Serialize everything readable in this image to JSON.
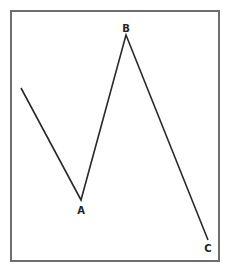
{
  "diagram": {
    "type": "zigzag-wave",
    "points": [
      {
        "name": "start",
        "x": 21,
        "y": 88,
        "label": ""
      },
      {
        "name": "A",
        "x": 81,
        "y": 200,
        "label": "A"
      },
      {
        "name": "B",
        "x": 126,
        "y": 35,
        "label": "B"
      },
      {
        "name": "C",
        "x": 208,
        "y": 240,
        "label": "C"
      }
    ],
    "labels": {
      "a": "A",
      "b": "B",
      "c": "C"
    },
    "colors": {
      "line": "#2a2a2a",
      "border": "#6e6e6e",
      "background": "#ffffff"
    }
  }
}
